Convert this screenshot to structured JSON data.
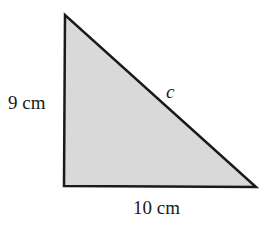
{
  "diagram": {
    "type": "right-triangle",
    "fill_color": "#d9d9d9",
    "stroke_color": "#1a1a1a",
    "labels": {
      "vertical_side": "9 cm",
      "horizontal_side": "10 cm",
      "hypotenuse": "c"
    }
  }
}
